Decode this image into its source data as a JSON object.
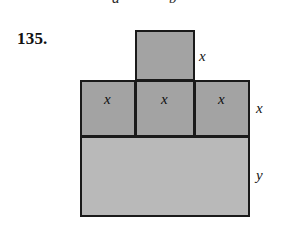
{
  "figure": {
    "problem_number": "135.",
    "clipped_labels_above": [
      {
        "text": "a"
      },
      {
        "text": "b"
      }
    ],
    "shapes": [
      {
        "id": "square-top",
        "role": "top-square",
        "fill": "#a3a3a3",
        "stroke": "#1a1a1a"
      },
      {
        "id": "square-mid-left",
        "role": "middle-square-left",
        "fill": "#a3a3a3",
        "stroke": "#1a1a1a"
      },
      {
        "id": "square-mid-center",
        "role": "middle-square-center",
        "fill": "#a3a3a3",
        "stroke": "#1a1a1a"
      },
      {
        "id": "square-mid-right",
        "role": "middle-square-right",
        "fill": "#a3a3a3",
        "stroke": "#1a1a1a"
      },
      {
        "id": "rect-bottom",
        "role": "bottom-rectangle",
        "fill": "#b9b9b9",
        "stroke": "#1a1a1a"
      }
    ],
    "inside_labels": [
      "x",
      "x",
      "x"
    ],
    "edge_labels": {
      "top_square_height": "x",
      "middle_row_height": "x",
      "bottom_rect_height": "y"
    }
  }
}
